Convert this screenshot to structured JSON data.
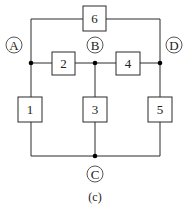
{
  "diagram": {
    "caption": "(c)",
    "components": [
      {
        "id": "1",
        "label": "1"
      },
      {
        "id": "2",
        "label": "2"
      },
      {
        "id": "3",
        "label": "3"
      },
      {
        "id": "4",
        "label": "4"
      },
      {
        "id": "5",
        "label": "5"
      },
      {
        "id": "6",
        "label": "6"
      }
    ],
    "nodes": [
      {
        "id": "A",
        "label": "A"
      },
      {
        "id": "B",
        "label": "B"
      },
      {
        "id": "C",
        "label": "C"
      },
      {
        "id": "D",
        "label": "D"
      }
    ],
    "connections": [
      {
        "component": "6",
        "between": [
          "A",
          "D"
        ]
      },
      {
        "component": "2",
        "between": [
          "A",
          "B"
        ]
      },
      {
        "component": "4",
        "between": [
          "B",
          "D"
        ]
      },
      {
        "component": "1",
        "between": [
          "A",
          "C"
        ]
      },
      {
        "component": "3",
        "between": [
          "B",
          "C"
        ]
      },
      {
        "component": "5",
        "between": [
          "D",
          "C"
        ]
      }
    ],
    "colors": {
      "line": "#2a2a2a",
      "background": "#ffffff"
    }
  }
}
